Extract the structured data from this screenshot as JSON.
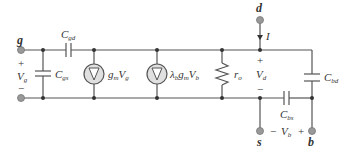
{
  "diagram": {
    "type": "small-signal equivalent circuit",
    "terminals": {
      "gate": "g",
      "drain": "d",
      "source": "s",
      "body": "b"
    },
    "labels": {
      "Cgd": {
        "main": "C",
        "sub": "gd"
      },
      "Cgs": {
        "main": "C",
        "sub": "gs"
      },
      "Cbd": {
        "main": "C",
        "sub": "bd"
      },
      "Cbs": {
        "main": "C",
        "sub": "bs"
      },
      "ro": {
        "main": "r",
        "sub": "o"
      },
      "gm_source": {
        "g": "g",
        "gsub": "m",
        "V": "V",
        "vsub": "g"
      },
      "body_source": {
        "lambda": "λ",
        "lsub": "b",
        "g": "g",
        "gsub": "m",
        "V": "V",
        "vsub": "b"
      },
      "Vg": {
        "main": "V",
        "sub": "g",
        "plus": "+",
        "minus": "−"
      },
      "Vd": {
        "main": "V",
        "sub": "d",
        "plus": "+",
        "minus": "−"
      },
      "Vb": {
        "main": "V",
        "sub": "b",
        "plus": "+",
        "minus": "−"
      },
      "current": "I"
    }
  }
}
